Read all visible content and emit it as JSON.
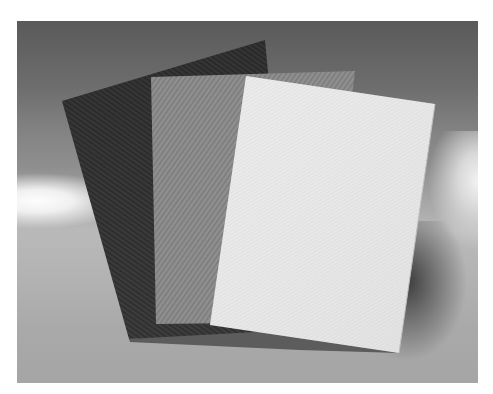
{
  "scene": {
    "description": "Three sheets of fabric fanned out on a seamless grey backdrop",
    "style": "grayscale product photograph",
    "background": {
      "top": "#5a5a5a",
      "mid_highlight": "#fdfdfd",
      "floor": "#b0b0b0"
    },
    "sheets": [
      {
        "name": "dark-sheet",
        "tone": "#3c3c3c",
        "texture": "diagonal twill"
      },
      {
        "name": "grey-sheet",
        "tone": "#8a8a8a",
        "texture": "diagonal twill"
      },
      {
        "name": "white-sheet",
        "tone": "#e6e6e6",
        "texture": "fine weave"
      }
    ]
  }
}
